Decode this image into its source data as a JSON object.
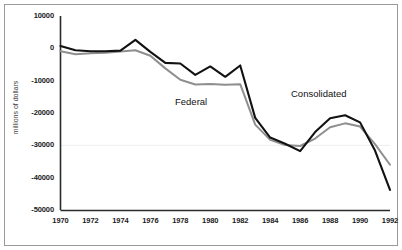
{
  "chart_data": {
    "type": "line",
    "title": "",
    "xlabel": "",
    "ylabel": "millions of dollars",
    "xlim": [
      1970,
      1992
    ],
    "ylim": [
      -50000,
      10000
    ],
    "ytick_values": [
      10000,
      0,
      -10000,
      -20000,
      -30000,
      -40000,
      -50000
    ],
    "ytick_labels": [
      "10000",
      "0",
      "-10000",
      "-20000",
      "-30000",
      "-40000",
      "-50000"
    ],
    "xtick_values": [
      1970,
      1972,
      1974,
      1976,
      1978,
      1980,
      1982,
      1984,
      1986,
      1988,
      1990,
      1992
    ],
    "xtick_labels": [
      "1970",
      "1972",
      "1974",
      "1976",
      "1978",
      "1980",
      "1982",
      "1984",
      "1986",
      "1988",
      "1990",
      "1992"
    ],
    "grid": true,
    "gridlines_y": [
      -30000
    ],
    "legend": "inline-annotations",
    "x": [
      1970,
      1971,
      1972,
      1973,
      1974,
      1975,
      1976,
      1977,
      1978,
      1979,
      1980,
      1981,
      1982,
      1983,
      1984,
      1985,
      1986,
      1987,
      1988,
      1989,
      1990,
      1991,
      1992
    ],
    "series": [
      {
        "name": "Federal",
        "color": "#121212",
        "values": [
          700,
          -600,
          -900,
          -900,
          -700,
          2600,
          -1100,
          -4500,
          -4700,
          -8200,
          -5600,
          -8800,
          -5300,
          -21500,
          -27600,
          -29500,
          -31800,
          -25900,
          -21600,
          -20700,
          -22900,
          -31600,
          -43800
        ]
      },
      {
        "name": "Consolidated",
        "color": "#8f8f8f",
        "values": [
          -900,
          -1800,
          -1500,
          -1400,
          -1000,
          -600,
          -2300,
          -6200,
          -9700,
          -11200,
          -11000,
          -11300,
          -11100,
          -23600,
          -28300,
          -29900,
          -30200,
          -27900,
          -24400,
          -23200,
          -24200,
          -29600,
          -36000
        ]
      }
    ],
    "annotations": [
      {
        "text": "Federal",
        "series": "Federal"
      },
      {
        "text": "Consolidated",
        "series": "Consolidated"
      }
    ]
  },
  "axis": {
    "y_title": "millions of dollars"
  }
}
